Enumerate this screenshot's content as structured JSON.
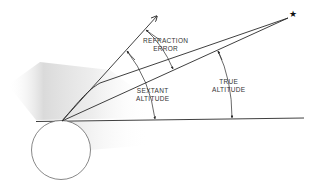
{
  "diagram": {
    "labels": {
      "refraction_error": [
        "REFRACTION",
        "ERROR"
      ],
      "sextant_altitude": [
        "SEXTANT",
        "ALTITUDE"
      ],
      "true_altitude": [
        "TRUE",
        "ALTITUDE"
      ]
    },
    "symbols": {
      "star": "★"
    },
    "colors": {
      "line": "#2a2a2a",
      "shading": "#d8d8d8",
      "text": "#333333",
      "background": "#ffffff"
    }
  }
}
